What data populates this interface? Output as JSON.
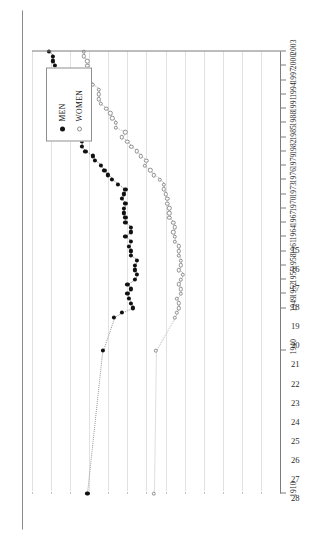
{
  "chart_data": {
    "type": "scatter",
    "title": "",
    "subtitle": "",
    "xlabel": "",
    "ylabel": "",
    "orientation": "rotated-90-ccw",
    "grid": true,
    "legend_position": "upper-right",
    "x": [
      1910,
      1940,
      1947,
      1948,
      1949,
      1950,
      1951,
      1952,
      1953,
      1954,
      1955,
      1956,
      1957,
      1958,
      1959,
      1960,
      1961,
      1962,
      1963,
      1964,
      1965,
      1966,
      1967,
      1968,
      1969,
      1970,
      1971,
      1972,
      1973,
      1974,
      1975,
      1976,
      1977,
      1978,
      1979,
      1980,
      1981,
      1982,
      1983,
      1984,
      1985,
      1986,
      1987,
      1988,
      1989,
      1990,
      1991,
      1992,
      1993,
      1994,
      1995,
      1996,
      1997,
      1998,
      1999,
      2000,
      2001,
      2002,
      2003
    ],
    "xlim": [
      1910,
      2003
    ],
    "ylim": [
      15,
      28
    ],
    "xticks": [
      1910,
      1940,
      1949,
      1952,
      1955,
      1958,
      1961,
      1964,
      1967,
      1970,
      1973,
      1976,
      1979,
      1982,
      1985,
      1988,
      1991,
      1994,
      1997,
      2000,
      2003
    ],
    "xticklabels": [
      "1910",
      "1940",
      "1949",
      "1952",
      "1955",
      "1958",
      "1961",
      "1964",
      "1967",
      "1970",
      "1973",
      "1976",
      "1979",
      "1982",
      "1985",
      "1988",
      "1991",
      "1994",
      "1997",
      "2000",
      "2003"
    ],
    "yticks": [
      28,
      27,
      26,
      25,
      24,
      23,
      22,
      21,
      20,
      19,
      18,
      17,
      16,
      15
    ],
    "yticklabels": [
      "28",
      "27",
      "26",
      "25",
      "24",
      "23",
      "22",
      "21",
      "20",
      "19",
      "18",
      "17",
      "16",
      "15"
    ],
    "series": [
      {
        "name": "MEN",
        "marker": "filled-circle",
        "color": "#111111",
        "values": [
          25.1,
          24.3,
          23.7,
          23.3,
          22.7,
          22.8,
          22.9,
          23.0,
          22.8,
          23.0,
          22.6,
          22.5,
          22.6,
          22.6,
          22.5,
          22.8,
          22.8,
          22.9,
          22.8,
          23.1,
          22.8,
          22.8,
          23.1,
          23.1,
          23.2,
          23.2,
          23.1,
          23.3,
          23.2,
          23.1,
          23.5,
          23.8,
          24.0,
          24.2,
          24.4,
          24.7,
          24.8,
          25.2,
          25.4,
          25.4,
          25.5,
          25.7,
          25.8,
          25.9,
          26.2,
          26.1,
          26.3,
          26.5,
          26.5,
          26.7,
          26.9,
          27.1,
          26.8,
          26.7,
          26.9,
          26.8,
          26.9,
          26.9,
          27.1
        ]
      },
      {
        "name": "WOMEN",
        "marker": "open-circle",
        "color": "#8d8d8d",
        "values": [
          21.6,
          21.5,
          20.5,
          20.4,
          20.3,
          20.3,
          20.4,
          20.2,
          20.2,
          20.3,
          20.2,
          20.1,
          20.3,
          20.2,
          20.2,
          20.3,
          20.3,
          20.3,
          20.5,
          20.5,
          20.6,
          20.5,
          20.6,
          20.8,
          20.8,
          20.8,
          20.9,
          20.9,
          21.0,
          21.1,
          21.1,
          21.3,
          21.6,
          21.8,
          22.1,
          22.0,
          22.3,
          22.5,
          22.8,
          23.0,
          23.3,
          23.1,
          23.6,
          23.6,
          23.8,
          23.9,
          24.1,
          24.4,
          24.5,
          24.5,
          24.5,
          24.8,
          25.0,
          25.0,
          25.1,
          25.1,
          25.1,
          25.3,
          25.3
        ]
      }
    ]
  },
  "legend": {
    "items": [
      {
        "label": "MEN",
        "marker": "filled-circle"
      },
      {
        "label": "WOMEN",
        "marker": "open-circle"
      }
    ]
  }
}
